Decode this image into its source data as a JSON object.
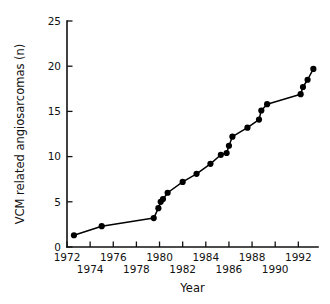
{
  "chart_data": {
    "type": "line",
    "title": "",
    "subtitle": "",
    "xlabel": "Year",
    "ylabel": "VCM related angiosarcomas (n)",
    "xlim": [
      1972,
      1993.7
    ],
    "ylim": [
      0,
      25
    ],
    "grid": false,
    "legend": null,
    "legend_position": "none",
    "marker": "filled-circle",
    "x_major_ticks": [
      1972,
      1974,
      1976,
      1978,
      1980,
      1982,
      1984,
      1986,
      1988,
      1990,
      1992
    ],
    "x_tick_labels": [
      "1972",
      "1974",
      "1976",
      "1978",
      "1980",
      "1982",
      "1984",
      "1986",
      "1988",
      "1990",
      "1992"
    ],
    "x_tick_label_rows": [
      0,
      1,
      0,
      1,
      0,
      1,
      0,
      1,
      0,
      1,
      0
    ],
    "y_major_ticks": [
      0,
      5,
      10,
      15,
      20,
      25
    ],
    "y_tick_labels": [
      "0",
      "5",
      "10",
      "15",
      "20",
      "25"
    ],
    "series": [
      {
        "name": "VCM related angiosarcomas",
        "x": [
          1972.6,
          1975.0,
          1979.5,
          1979.9,
          1980.1,
          1980.3,
          1980.7,
          1982.0,
          1983.2,
          1984.4,
          1985.3,
          1985.8,
          1986.0,
          1986.3,
          1987.6,
          1988.6,
          1988.8,
          1989.3,
          1992.2,
          1992.4,
          1992.8,
          1993.3
        ],
        "y": [
          1.3,
          2.3,
          3.2,
          4.3,
          5.0,
          5.3,
          6.0,
          7.2,
          8.1,
          9.2,
          10.2,
          10.4,
          11.2,
          12.2,
          13.2,
          14.1,
          15.1,
          15.8,
          16.9,
          17.7,
          18.5,
          19.7
        ],
        "color": "#000000"
      }
    ]
  },
  "axis_titles": {
    "x": "Year",
    "y": "VCM related angiosarcomas (n)"
  }
}
